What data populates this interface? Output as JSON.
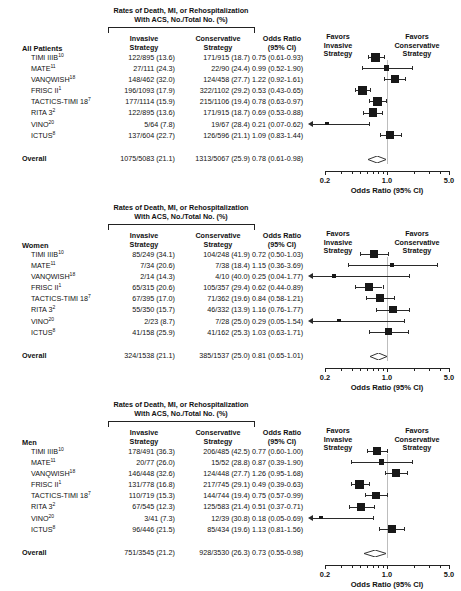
{
  "figure": {
    "axis_title": "Odds Ratio (95% CI)",
    "scale": "log",
    "xlim": [
      0.2,
      5.0
    ],
    "tick_labels": [
      "0.2",
      "1.0",
      "5.0"
    ],
    "tick_values": [
      0.2,
      1.0,
      5.0
    ],
    "minor_ticks": [
      0.3,
      0.4,
      0.5,
      0.6,
      0.7,
      0.8,
      0.9,
      2.0,
      3.0,
      4.0
    ],
    "null_value": 1.0,
    "favors_left": "Favors\nInvasive\nStrategy",
    "favors_right": "Favors\nConservative\nStrategy",
    "favors_left_lines": [
      "Favors",
      "Invasive",
      "Strategy"
    ],
    "favors_right_lines": [
      "Favors",
      "Conservative",
      "Strategy"
    ],
    "header_title_lines": [
      "Rates of Death, MI, or Rehospitalization",
      "With ACS, No./Total No. (%)"
    ],
    "col_invasive_lines": [
      "Invasive",
      "Strategy"
    ],
    "col_conservative_lines": [
      "Conservative",
      "Strategy"
    ],
    "col_or_lines": [
      "Odds Ratio",
      "(95% CI)"
    ],
    "overall_label": "Overall"
  },
  "chart_data": {
    "type": "forest",
    "xlabel": "Odds Ratio (95% CI)",
    "ylabel": "",
    "xscale": "log",
    "xlim": [
      0.2,
      5.0
    ],
    "xticks": [
      0.2,
      1.0,
      5.0
    ],
    "grid": false,
    "legend": "none",
    "panels": [
      {
        "group": "All Patients",
        "rows": [
          {
            "study": "TIMI IIIB",
            "ref": "10",
            "invasive": "122/895 (13.6)",
            "conservative": "171/915 (18.7)",
            "or_text": "0.75 (0.61-0.93)",
            "or": 0.75,
            "lcl": 0.61,
            "ucl": 0.93,
            "weight": 0.8,
            "clipped_left": false
          },
          {
            "study": "MATE",
            "ref": "11",
            "invasive": "27/111 (24.3)",
            "conservative": "22/90 (24.4)",
            "or_text": "0.99 (0.52-1.90)",
            "or": 0.99,
            "lcl": 0.52,
            "ucl": 1.9,
            "weight": 0.34,
            "clipped_left": false
          },
          {
            "study": "VANQWISH",
            "ref": "18",
            "invasive": "148/462 (32.0)",
            "conservative": "124/458 (27.7)",
            "or_text": "1.22 (0.92-1.61)",
            "or": 1.22,
            "lcl": 0.92,
            "ucl": 1.61,
            "weight": 0.66,
            "clipped_left": false
          },
          {
            "study": "FRISC II",
            "ref": "1",
            "invasive": "196/1093 (17.9)",
            "conservative": "322/1102 (29.2)",
            "or_text": "0.53 (0.43-0.65)",
            "or": 0.53,
            "lcl": 0.43,
            "ucl": 0.65,
            "weight": 0.86,
            "clipped_left": false
          },
          {
            "study": "TACTICS-TIMI 18",
            "ref": "7",
            "invasive": "177/1114 (15.9)",
            "conservative": "215/1106 (19.4)",
            "or_text": "0.78 (0.63-0.97)",
            "or": 0.78,
            "lcl": 0.63,
            "ucl": 0.97,
            "weight": 0.82,
            "clipped_left": false
          },
          {
            "study": "RITA 3",
            "ref": "2",
            "invasive": "122/895 (13.6)",
            "conservative": "171/915 (18.7)",
            "or_text": "0.69 (0.53-0.88)",
            "or": 0.69,
            "lcl": 0.53,
            "ucl": 0.88,
            "weight": 0.72,
            "clipped_left": false
          },
          {
            "study": "VINO",
            "ref": "20",
            "invasive": "5/64 (7.8)",
            "conservative": "19/67 (28.4)",
            "or_text": "0.21 (0.07-0.62)",
            "or": 0.21,
            "lcl": 0.07,
            "ucl": 0.62,
            "weight": 0.1,
            "clipped_left": true
          },
          {
            "study": "ICTUS",
            "ref": "8",
            "invasive": "137/604 (22.7)",
            "conservative": "126/596 (21.1)",
            "or_text": "1.09 (0.83-1.44)",
            "or": 1.09,
            "lcl": 0.83,
            "ucl": 1.44,
            "weight": 0.72,
            "clipped_left": false
          }
        ],
        "overall": {
          "invasive": "1075/5083 (21.1)",
          "conservative": "1313/5067 (25.9)",
          "or_text": "0.78 (0.61-0.98)",
          "or": 0.78,
          "lcl": 0.61,
          "ucl": 0.98
        }
      },
      {
        "group": "Women",
        "rows": [
          {
            "study": "TIMI IIIB",
            "ref": "10",
            "invasive": "85/249 (34.1)",
            "conservative": "104/248 (41.9)",
            "or_text": "0.72 (0.50-1.03)",
            "or": 0.72,
            "lcl": 0.5,
            "ucl": 1.03,
            "weight": 0.72,
            "clipped_left": false
          },
          {
            "study": "MATE",
            "ref": "11",
            "invasive": "7/34 (20.6)",
            "conservative": "7/38 (18.4)",
            "or_text": "1.15 (0.36-3.69)",
            "or": 1.15,
            "lcl": 0.36,
            "ucl": 3.69,
            "weight": 0.16,
            "clipped_left": false
          },
          {
            "study": "VANQWISH",
            "ref": "18",
            "invasive": "2/14 (14.3)",
            "conservative": "4/10 (40.0)",
            "or_text": "0.25 (0.04-1.77)",
            "or": 0.25,
            "lcl": 0.04,
            "ucl": 1.77,
            "weight": 0.14,
            "clipped_left": true
          },
          {
            "study": "FRISC II",
            "ref": "1",
            "invasive": "65/315 (20.6)",
            "conservative": "105/357 (29.4)",
            "or_text": "0.62 (0.44-0.89)",
            "or": 0.62,
            "lcl": 0.44,
            "ucl": 0.89,
            "weight": 0.7,
            "clipped_left": false
          },
          {
            "study": "TACTICS-TIMI 18",
            "ref": "7",
            "invasive": "67/395 (17.0)",
            "conservative": "71/362 (19.6)",
            "or_text": "0.84 (0.58-1.21)",
            "or": 0.84,
            "lcl": 0.58,
            "ucl": 1.21,
            "weight": 0.68,
            "clipped_left": false
          },
          {
            "study": "RITA 3",
            "ref": "2",
            "invasive": "55/350 (15.7)",
            "conservative": "46/332 (13.9)",
            "or_text": "1.16 (0.76-1.77)",
            "or": 1.16,
            "lcl": 0.76,
            "ucl": 1.77,
            "weight": 0.62,
            "clipped_left": false
          },
          {
            "study": "VINO",
            "ref": "20",
            "invasive": "2/23 (8.7)",
            "conservative": "7/28 (25.0)",
            "or_text": "0.29 (0.05-1.54)",
            "or": 0.29,
            "lcl": 0.05,
            "ucl": 1.54,
            "weight": 0.12,
            "clipped_left": true
          },
          {
            "study": "ICTUS",
            "ref": "8",
            "invasive": "41/158 (25.9)",
            "conservative": "41/162 (25.3)",
            "or_text": "1.03 (0.63-1.71)",
            "or": 1.03,
            "lcl": 0.63,
            "ucl": 1.71,
            "weight": 0.56,
            "clipped_left": false
          }
        ],
        "overall": {
          "invasive": "324/1538 (21.1)",
          "conservative": "385/1537 (25.0)",
          "or_text": "0.81 (0.65-1.01)",
          "or": 0.81,
          "lcl": 0.65,
          "ucl": 1.01
        }
      },
      {
        "group": "Men",
        "rows": [
          {
            "study": "TIMI IIIB",
            "ref": "10",
            "invasive": "178/491 (36.3)",
            "conservative": "206/485 (42.5)",
            "or_text": "0.77 (0.60-1.00)",
            "or": 0.77,
            "lcl": 0.6,
            "ucl": 1.0,
            "weight": 0.7,
            "clipped_left": false
          },
          {
            "study": "MATE",
            "ref": "11",
            "invasive": "20/77 (26.0)",
            "conservative": "15/52 (28.8)",
            "or_text": "0.87 (0.39-1.90)",
            "or": 0.87,
            "lcl": 0.39,
            "ucl": 1.9,
            "weight": 0.36,
            "clipped_left": false
          },
          {
            "study": "VANQWISH",
            "ref": "18",
            "invasive": "146/448 (32.6)",
            "conservative": "124/448 (27.7)",
            "or_text": "1.26 (0.95-1.68)",
            "or": 1.26,
            "lcl": 0.95,
            "ucl": 1.68,
            "weight": 0.7,
            "clipped_left": false
          },
          {
            "study": "FRISC II",
            "ref": "1",
            "invasive": "131/778 (16.8)",
            "conservative": "217/745 (29.1)",
            "or_text": "0.49 (0.39-0.63)",
            "or": 0.49,
            "lcl": 0.39,
            "ucl": 0.63,
            "weight": 0.8,
            "clipped_left": false
          },
          {
            "study": "TACTICS-TIMI 18",
            "ref": "7",
            "invasive": "110/719 (15.3)",
            "conservative": "144/744 (19.4)",
            "or_text": "0.75 (0.57-0.99)",
            "or": 0.75,
            "lcl": 0.57,
            "ucl": 0.99,
            "weight": 0.62,
            "clipped_left": false
          },
          {
            "study": "RITA 3",
            "ref": "2",
            "invasive": "67/545 (12.3)",
            "conservative": "125/583 (21.4)",
            "or_text": "0.51 (0.37-0.71)",
            "or": 0.51,
            "lcl": 0.37,
            "ucl": 0.71,
            "weight": 0.66,
            "clipped_left": false
          },
          {
            "study": "VINO",
            "ref": "20",
            "invasive": "3/41 (7.3)",
            "conservative": "12/39 (30.8)",
            "or_text": "0.18 (0.05-0.69)",
            "or": 0.18,
            "lcl": 0.05,
            "ucl": 0.69,
            "weight": 0.1,
            "clipped_left": true
          },
          {
            "study": "ICTUS",
            "ref": "8",
            "invasive": "96/446 (21.5)",
            "conservative": "85/434 (19.6)",
            "or_text": "1.13 (0.81-1.56)",
            "or": 1.13,
            "lcl": 0.81,
            "ucl": 1.56,
            "weight": 0.72,
            "clipped_left": false
          }
        ],
        "overall": {
          "invasive": "751/3545 (21.2)",
          "conservative": "928/3530 (26.3)",
          "or_text": "0.73 (0.55-0.98)",
          "or": 0.73,
          "lcl": 0.55,
          "ucl": 0.98
        }
      }
    ]
  }
}
